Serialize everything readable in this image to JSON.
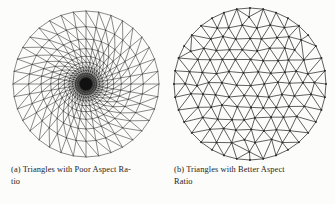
{
  "figure": {
    "background_color": "#fcfcfa",
    "ink_color": "#2b2b2b",
    "panel_count": 2
  },
  "panels": [
    {
      "id": "panel-a",
      "label": "(a)",
      "mesh_type": "radial-polar",
      "quality": "poor-aspect-ratio",
      "center": {
        "cx": 86,
        "cy": 84
      },
      "radius": 73,
      "spokes": 36,
      "rings": 22,
      "ring_shrink_factor": 0.785,
      "min_ring_radius": 1.2,
      "diagonal_direction": "ccw",
      "has_dense_core": true,
      "core_radius": 9,
      "core_color": "#101010",
      "stroke_width": 0.55
    },
    {
      "id": "panel-b",
      "label": "(b)",
      "mesh_type": "uniform-delaunay",
      "quality": "better-aspect-ratio",
      "center": {
        "cx": 80,
        "cy": 84
      },
      "radius": 76,
      "target_edge_length": 13.2,
      "boundary_segments": 36,
      "interior_rings": 6,
      "jitter": 0.28,
      "vertex_dot_radius": 0.95,
      "stroke_width": 0.75
    }
  ],
  "captions": {
    "a": {
      "tag": "(a)",
      "line1": "Triangles with Poor Aspect Ra-",
      "line2": "tio",
      "full_text": "(a) Triangles with Poor Aspect Ratio"
    },
    "b": {
      "tag": "(b)",
      "line1": "Triangles with Better Aspect",
      "line2": "Ratio",
      "full_text": "(b) Triangles with Better Aspect Ratio"
    }
  }
}
